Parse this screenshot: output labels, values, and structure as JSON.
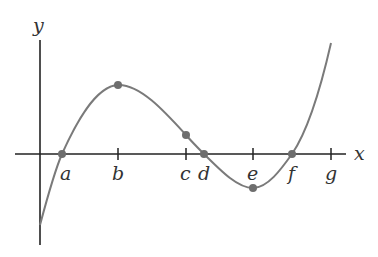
{
  "diagram": {
    "type": "function-graph",
    "axes": {
      "x_label": "x",
      "y_label": "y"
    },
    "ticks": [
      {
        "label": "a",
        "x": 62
      },
      {
        "label": "b",
        "x": 118
      },
      {
        "label": "c",
        "x": 186
      },
      {
        "label": "d",
        "x": 204
      },
      {
        "label": "e",
        "x": 253
      },
      {
        "label": "f",
        "x": 292
      },
      {
        "label": "g",
        "x": 331
      }
    ],
    "points": [
      {
        "name": "root-a",
        "x": 62,
        "y": 154
      },
      {
        "name": "local-max-b",
        "x": 118,
        "y": 85
      },
      {
        "name": "inflection-c",
        "x": 186,
        "y": 135
      },
      {
        "name": "root-d",
        "x": 204,
        "y": 154
      },
      {
        "name": "local-min-e",
        "x": 253,
        "y": 188
      },
      {
        "name": "root-f",
        "x": 292,
        "y": 154
      }
    ],
    "colors": {
      "axis": "#222222",
      "curve": "#7a7a7a",
      "point": "#6e6e6e",
      "label": "#333333"
    }
  }
}
